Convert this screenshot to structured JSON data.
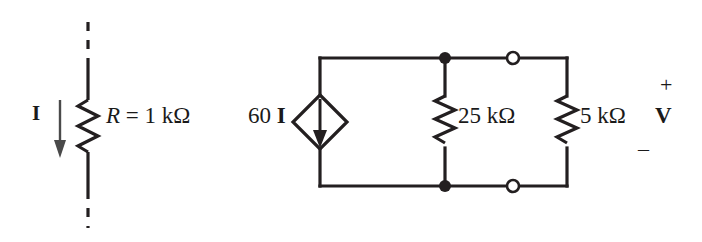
{
  "figure": {
    "type": "electrical-circuit-schematic",
    "background_color": "#ffffff",
    "line_color": "#231f20"
  },
  "left_branch": {
    "current_label": "I",
    "current_direction": "downward",
    "resistor_label": "R = 1 kΩ",
    "resistor_label_symbol": "R",
    "resistor_label_rest": " = 1 kΩ",
    "terminal_style": "dashed-line-above-and-below"
  },
  "right_network": {
    "source": {
      "label": "60 I",
      "label_coefficient": "60 ",
      "label_variable": "I",
      "type": "dependent-current-source",
      "shape": "diamond",
      "arrow_direction": "downward"
    },
    "resistors": [
      {
        "name": "r25",
        "label": "25 kΩ",
        "orientation": "vertical"
      },
      {
        "name": "r5",
        "label": "5 kΩ",
        "orientation": "vertical"
      }
    ],
    "terminals": {
      "top_node_style": "filled",
      "top_terminal_style": "open",
      "bottom_node_style": "filled",
      "bottom_terminal_style": "open"
    },
    "output": {
      "plus_sign": "+",
      "voltage_label": "V",
      "minus_sign": "_"
    }
  }
}
